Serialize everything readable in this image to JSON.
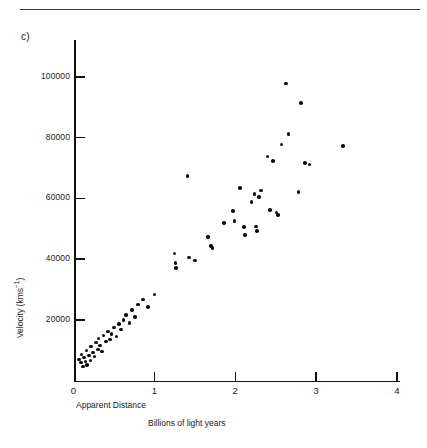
{
  "figure": {
    "panel_label": "c)",
    "has_top_rule": true
  },
  "chart_data": {
    "type": "scatter",
    "title": "",
    "xlabel": "Apparent Distance",
    "xlabel_units": "Billions of light years",
    "ylabel": "Velocity (kms⁻¹)",
    "xlim": [
      0,
      4
    ],
    "ylim": [
      0,
      110000
    ],
    "grid": false,
    "legend": null,
    "xticks": [
      0,
      1,
      2,
      3,
      4
    ],
    "xticklabels": [
      "0",
      "1",
      "2",
      "3",
      "4"
    ],
    "yticks": [
      20000,
      40000,
      60000,
      80000,
      100000
    ],
    "yticklabels": [
      "20000",
      "40000",
      "60000",
      "80000",
      "100000"
    ],
    "points": [
      {
        "x": 0.07,
        "y": 6900
      },
      {
        "x": 0.09,
        "y": 5900
      },
      {
        "x": 0.1,
        "y": 8600
      },
      {
        "x": 0.12,
        "y": 4600
      },
      {
        "x": 0.13,
        "y": 7600
      },
      {
        "x": 0.15,
        "y": 6200
      },
      {
        "x": 0.16,
        "y": 9900
      },
      {
        "x": 0.17,
        "y": 5200
      },
      {
        "x": 0.19,
        "y": 8200
      },
      {
        "x": 0.21,
        "y": 6600
      },
      {
        "x": 0.22,
        "y": 11200
      },
      {
        "x": 0.24,
        "y": 9200
      },
      {
        "x": 0.26,
        "y": 7900
      },
      {
        "x": 0.28,
        "y": 12500
      },
      {
        "x": 0.3,
        "y": 10200
      },
      {
        "x": 0.31,
        "y": 13800
      },
      {
        "x": 0.33,
        "y": 11500
      },
      {
        "x": 0.35,
        "y": 9500
      },
      {
        "x": 0.37,
        "y": 14800
      },
      {
        "x": 0.4,
        "y": 12800
      },
      {
        "x": 0.43,
        "y": 16100
      },
      {
        "x": 0.45,
        "y": 13500
      },
      {
        "x": 0.47,
        "y": 15400
      },
      {
        "x": 0.5,
        "y": 17400
      },
      {
        "x": 0.53,
        "y": 14500
      },
      {
        "x": 0.56,
        "y": 18700
      },
      {
        "x": 0.59,
        "y": 16800
      },
      {
        "x": 0.62,
        "y": 20000
      },
      {
        "x": 0.65,
        "y": 21600
      },
      {
        "x": 0.69,
        "y": 19000
      },
      {
        "x": 0.72,
        "y": 23200
      },
      {
        "x": 0.76,
        "y": 21000
      },
      {
        "x": 0.8,
        "y": 25100
      },
      {
        "x": 0.86,
        "y": 26700
      },
      {
        "x": 0.92,
        "y": 24200
      },
      {
        "x": 1.0,
        "y": 28400
      },
      {
        "x": 1.25,
        "y": 41800
      },
      {
        "x": 1.26,
        "y": 38700
      },
      {
        "x": 1.27,
        "y": 37000
      },
      {
        "x": 1.43,
        "y": 40500
      },
      {
        "x": 1.5,
        "y": 39500
      },
      {
        "x": 1.41,
        "y": 67300
      },
      {
        "x": 1.66,
        "y": 47300
      },
      {
        "x": 1.7,
        "y": 44400
      },
      {
        "x": 1.72,
        "y": 43600
      },
      {
        "x": 1.86,
        "y": 51800
      },
      {
        "x": 1.97,
        "y": 55800
      },
      {
        "x": 1.99,
        "y": 52600
      },
      {
        "x": 2.06,
        "y": 63400
      },
      {
        "x": 2.11,
        "y": 50500
      },
      {
        "x": 2.12,
        "y": 47900
      },
      {
        "x": 2.2,
        "y": 58800
      },
      {
        "x": 2.24,
        "y": 61400
      },
      {
        "x": 2.29,
        "y": 60400
      },
      {
        "x": 2.32,
        "y": 62600
      },
      {
        "x": 2.26,
        "y": 50800
      },
      {
        "x": 2.27,
        "y": 49200
      },
      {
        "x": 2.4,
        "y": 73800
      },
      {
        "x": 2.47,
        "y": 72400
      },
      {
        "x": 2.43,
        "y": 56200
      },
      {
        "x": 2.51,
        "y": 55400
      },
      {
        "x": 2.53,
        "y": 54500
      },
      {
        "x": 2.57,
        "y": 77800
      },
      {
        "x": 2.63,
        "y": 97800
      },
      {
        "x": 2.66,
        "y": 81200
      },
      {
        "x": 2.81,
        "y": 91500
      },
      {
        "x": 2.86,
        "y": 71600
      },
      {
        "x": 2.92,
        "y": 71200
      },
      {
        "x": 2.78,
        "y": 62200
      },
      {
        "x": 3.33,
        "y": 77200
      }
    ]
  }
}
